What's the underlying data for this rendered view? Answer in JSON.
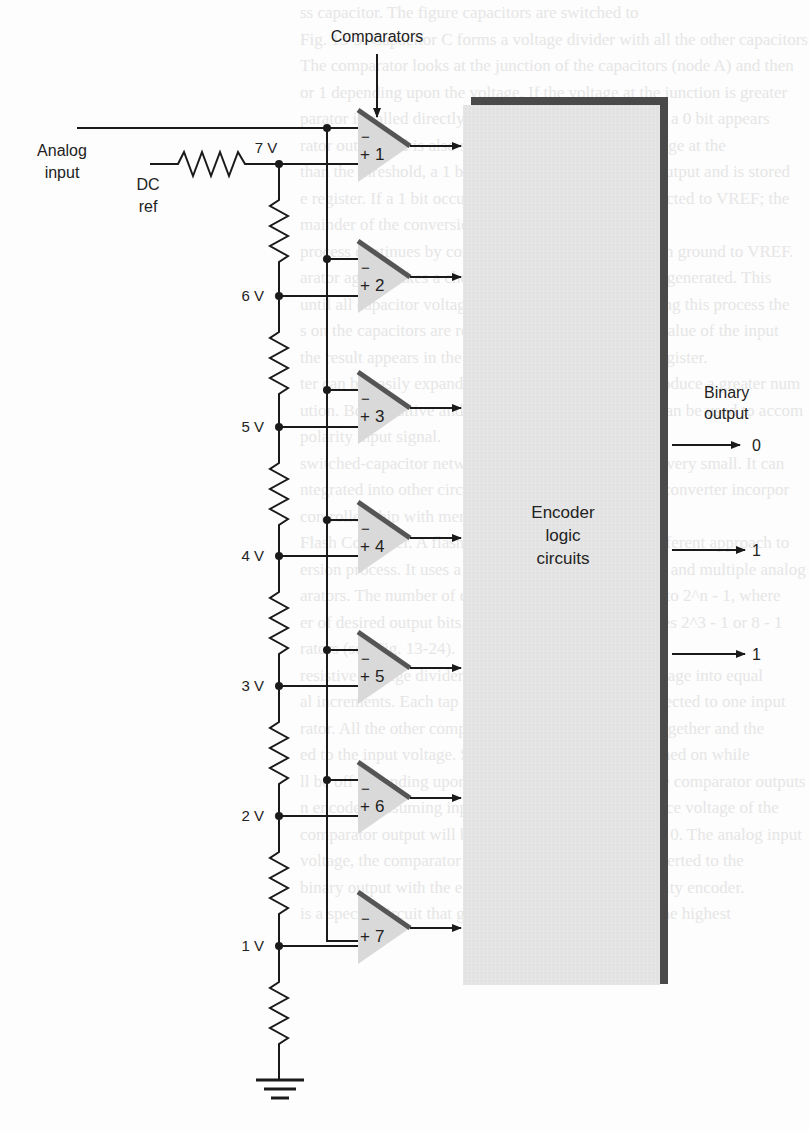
{
  "figure": {
    "title_label": "Comparators",
    "analog_input_label": [
      "Analog",
      "input"
    ],
    "dc_ref_label": [
      "DC",
      "ref"
    ],
    "encoder_label": [
      "Encoder",
      "logic",
      "circuits"
    ],
    "binary_output_label": [
      "Binary",
      "output"
    ],
    "binary_outputs": [
      "0",
      "1",
      "1"
    ],
    "node_voltages": [
      "7 V",
      "6 V",
      "5 V",
      "4 V",
      "3 V",
      "2 V",
      "1 V"
    ],
    "comparators": [
      {
        "id": "1",
        "minus": "−",
        "plus": "+"
      },
      {
        "id": "2",
        "minus": "−",
        "plus": "+"
      },
      {
        "id": "3",
        "minus": "−",
        "plus": "+"
      },
      {
        "id": "4",
        "minus": "−",
        "plus": "+"
      },
      {
        "id": "5",
        "minus": "−",
        "plus": "+"
      },
      {
        "id": "6",
        "minus": "−",
        "plus": "+"
      },
      {
        "id": "7",
        "minus": "−",
        "plus": "+"
      }
    ],
    "colors": {
      "wire": "#1a1a1a",
      "comparator_fill": "#d9d9d9",
      "comparator_edge": "#555555",
      "block_fill": "#e4e4e4",
      "block_shadow": "#4a4a4a",
      "faded_text": "#e3e3e3"
    }
  },
  "background_text": [
    "ss capacitor. The figure capacitors are switched to",
    "Fig. 13-5. Capacitor C forms a voltage divider with all the other capacitors",
    "The comparator looks at the junction of the capacitors (node A) and then",
    "or 1 depending upon the voltage. If the voltage at the junction is greater",
    "parator is called directly one-half of the input voltage, a 0 bit appears",
    "rator output and is also stored in a register. If the voltage at the",
    "than the threshold, a 1 bit appears at the comparator output and is stored",
    "e register. If a 1 bit occurs, capacitor C remains connected to VREF; the",
    "mainder of the conversion.",
    "process continues by connecting the 2C capacitor from ground to VREF.",
    "arator again makes a choice, and another output bit is generated. This",
    "until all capacitor voltages have been compared. During this process the",
    "s on the capacitors are redistributed according to the value of the input",
    "the result appears in the successive-approximations register.",
    "ter can be easily expanded with more capacitors to produce a greater num",
    "ution. Both positive and negative reference voltages can be used to accom",
    "polarity input signal.",
    "switched-capacitor network makes the A/D converter very small. It can",
    "ntegrated into other circuits. A typical chip is an A/D converter incorpor",
    "controller chip with memory.",
    "",
    "Flash Converter. A flash converter uses an entirely different approach to",
    "ersion process. It uses a large resistive voltage divider and multiple analog",
    "arators. The number of comparators required is equal to 2^n - 1, where",
    "er of desired output bits. A 3-bit A/D converter requires 2^3 - 1 or 8 - 1",
    "rators (see Fig. 13-24).",
    "resistive voltage divider divides the DC reference voltage into equal",
    "al increments. Each tap on the voltage divider is connected to one input",
    "rator. All the other comparator inputs are connected together and the",
    "ed to the input voltage. Some comparators will be turned on while",
    "ll be off depending upon the analog input voltage. The comparator outputs",
    "n encoder. Assuming inputs is greater than the reference voltage of the",
    "comparator output will be 1; if less, the output will be 0. The analog input",
    "voltage, the comparator outputs are decoded and converted to the",
    "binary output with the encoder. The encoder is a priority encoder.",
    "is a special circuit that generates the binary value of the highest"
  ]
}
